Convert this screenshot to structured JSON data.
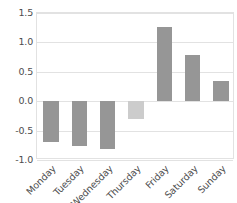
{
  "chart_data": {
    "type": "bar",
    "title": "",
    "subtitle": "",
    "xlabel": "",
    "ylabel": "",
    "categories": [
      "Monday",
      "Tuesday",
      "Wednesday",
      "Thursday",
      "Friday",
      "Saturday",
      "Sunday"
    ],
    "values": [
      -0.7,
      -0.76,
      -0.82,
      -0.3,
      1.26,
      0.78,
      0.34
    ],
    "bar_colors": [
      "#969696",
      "#969696",
      "#969696",
      "#cccccc",
      "#969696",
      "#969696",
      "#969696"
    ],
    "ylim": [
      -1.0,
      1.5
    ],
    "ytick_labels": [
      "1.5",
      "1.0",
      "0.5",
      "0.0",
      "-0.5",
      "-1.0"
    ],
    "ytick_values": [
      1.5,
      1.0,
      0.5,
      0.0,
      -0.5,
      -1.0
    ],
    "grid": true,
    "grid_axis": "y",
    "legend": false,
    "legend_position": "none",
    "xtick_rotation": -45,
    "axis_color": "#e2e2e2",
    "grid_color": "#e2e2e2",
    "tick_label_color": "#4d4d4d",
    "background_color": "#ffffff",
    "bar_width_ratio": 0.55
  }
}
